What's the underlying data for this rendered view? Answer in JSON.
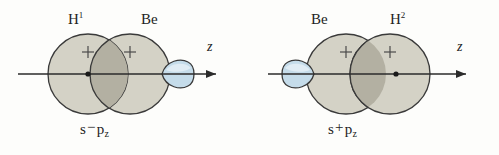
{
  "figure": {
    "background_color": "#fdfdfb"
  },
  "style": {
    "orbital_fill": "#d4d2c6",
    "orbital_overlap_fill": "#b3b0a2",
    "orbital_stroke": "#3a3a3a",
    "p_orbital_fill": "#c5dcea",
    "p_orbital_stroke": "#3a3a3a",
    "axis_color": "#2b2b2b",
    "nucleus_color": "#1a1a1a",
    "text_color": "#232323"
  },
  "panels": [
    {
      "id": "left",
      "top_labels": [
        {
          "name": "label-h1",
          "text": "H",
          "superscript": "1"
        },
        {
          "name": "label-be-left",
          "text": "Be",
          "superscript": ""
        }
      ],
      "axis": {
        "label": "z",
        "direction": "right"
      },
      "orbitals": [
        {
          "kind": "s",
          "sign": "+",
          "owner": "H1",
          "nucleus": true
        },
        {
          "kind": "s",
          "sign": "+",
          "owner": "Be",
          "nucleus": false
        },
        {
          "kind": "p_lobe",
          "sign": "",
          "owner": "Be",
          "points": "right"
        }
      ],
      "combination": {
        "first": "s",
        "operator": "−",
        "second": "p",
        "subscript": "z"
      }
    },
    {
      "id": "right",
      "top_labels": [
        {
          "name": "label-be-right",
          "text": "Be",
          "superscript": ""
        },
        {
          "name": "label-h2",
          "text": "H",
          "superscript": "2"
        }
      ],
      "axis": {
        "label": "z",
        "direction": "right"
      },
      "orbitals": [
        {
          "kind": "p_lobe",
          "sign": "",
          "owner": "Be",
          "points": "left"
        },
        {
          "kind": "s",
          "sign": "+",
          "owner": "Be",
          "nucleus": false
        },
        {
          "kind": "s",
          "sign": "+",
          "owner": "H2",
          "nucleus": true
        }
      ],
      "combination": {
        "first": "s",
        "operator": "+",
        "second": "p",
        "subscript": "z"
      }
    }
  ],
  "plus_signs": {
    "glyph": "+"
  }
}
